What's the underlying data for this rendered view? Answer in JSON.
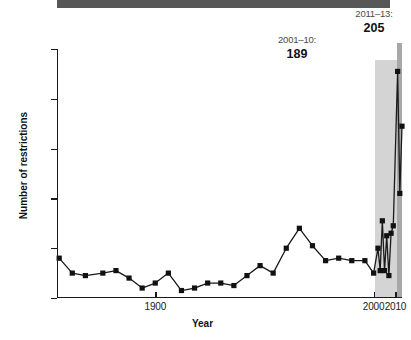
{
  "chart_data": {
    "type": "line",
    "title": "",
    "xlabel": "Year",
    "ylabel": "Number of restrictions",
    "xlim": [
      1855,
      2013
    ],
    "ylim": [
      0,
      100
    ],
    "yticks": [
      0,
      20,
      40,
      60,
      80,
      100
    ],
    "xticks": [
      1900,
      2000,
      2010
    ],
    "grid": false,
    "legend": false,
    "marker": "square",
    "line_color": "#1a1a1a",
    "marker_color": "#111111",
    "x": [
      1856,
      1860,
      1864,
      1868,
      1872,
      1876,
      1880,
      1884,
      1888,
      1892,
      1896,
      1900,
      1904,
      1908,
      1912,
      1916,
      1920,
      1924,
      1928,
      1932,
      1936,
      1940,
      1944,
      1948,
      1952,
      1956,
      1960,
      1964,
      1968,
      1972,
      1976,
      1980,
      1984,
      1988,
      1992,
      1996,
      2000,
      2001,
      2002,
      2003,
      2004,
      2005,
      2006,
      2007,
      2008,
      2009,
      2010,
      2011,
      2012,
      2013
    ],
    "values": [
      16,
      12,
      10,
      9,
      9,
      9,
      11,
      11,
      10,
      8,
      7,
      4,
      5,
      10,
      7,
      3,
      3,
      4,
      6,
      6,
      5,
      5,
      8,
      11,
      13,
      12,
      10,
      15,
      20,
      28,
      25,
      21,
      15,
      15,
      16,
      15,
      15,
      13,
      10,
      15,
      20,
      11,
      31,
      11,
      25,
      9,
      18,
      26,
      29,
      91
    ],
    "series": [
      {
        "name": "Number of restrictions",
        "points": [
          {
            "year": 1856,
            "value": 16
          },
          {
            "year": 1862,
            "value": 10
          },
          {
            "year": 1868,
            "value": 9
          },
          {
            "year": 1876,
            "value": 10
          },
          {
            "year": 1882,
            "value": 11
          },
          {
            "year": 1888,
            "value": 8
          },
          {
            "year": 1894,
            "value": 4
          },
          {
            "year": 1900,
            "value": 6
          },
          {
            "year": 1906,
            "value": 10
          },
          {
            "year": 1912,
            "value": 3
          },
          {
            "year": 1918,
            "value": 4
          },
          {
            "year": 1924,
            "value": 6
          },
          {
            "year": 1930,
            "value": 6
          },
          {
            "year": 1936,
            "value": 5
          },
          {
            "year": 1942,
            "value": 9
          },
          {
            "year": 1948,
            "value": 13
          },
          {
            "year": 1954,
            "value": 10
          },
          {
            "year": 1960,
            "value": 20
          },
          {
            "year": 1966,
            "value": 28
          },
          {
            "year": 1972,
            "value": 21
          },
          {
            "year": 1978,
            "value": 15
          },
          {
            "year": 1984,
            "value": 16
          },
          {
            "year": 1990,
            "value": 15
          },
          {
            "year": 1996,
            "value": 15
          },
          {
            "year": 2000,
            "value": 10
          },
          {
            "year": 2002,
            "value": 20
          },
          {
            "year": 2003,
            "value": 11
          },
          {
            "year": 2004,
            "value": 31
          },
          {
            "year": 2005,
            "value": 11
          },
          {
            "year": 2006,
            "value": 25
          },
          {
            "year": 2007,
            "value": 9
          },
          {
            "year": 2008,
            "value": 26
          },
          {
            "year": 2009,
            "value": 29
          },
          {
            "year": 2011,
            "value": 91
          },
          {
            "year": 2012,
            "value": 42
          },
          {
            "year": 2013,
            "value": 69
          }
        ]
      }
    ],
    "bands": [
      {
        "name": "2001-2010",
        "range_label": "2001–10:",
        "total": "189",
        "x_start": 2001,
        "x_end": 2010,
        "color": "#d4d4d4"
      },
      {
        "name": "2011-2013",
        "range_label": "2011–13:",
        "total": "205",
        "x_start": 2011,
        "x_end": 2013,
        "color": "#a8a8a8"
      }
    ],
    "annotations": [
      {
        "text": "2001–10:",
        "value": "189"
      },
      {
        "text": "2011–13:",
        "value": "205"
      }
    ]
  },
  "axes": {
    "y_title": "Number of restrictions",
    "x_title": "Year",
    "y_tick_labels": [
      "100",
      "80",
      "60",
      "40",
      "20",
      "0"
    ],
    "x_tick_labels": [
      "1900",
      "2000",
      "2010"
    ]
  },
  "annotations": {
    "band_light": {
      "range": "2001–10:",
      "total": "189"
    },
    "band_dark": {
      "range": "2011–13:",
      "total": "205"
    }
  },
  "colors": {
    "header_bar": "#575757",
    "band_light": "#d4d4d4",
    "band_dark": "#a8a8a8",
    "line": "#1a1a1a",
    "background": "#ffffff"
  }
}
